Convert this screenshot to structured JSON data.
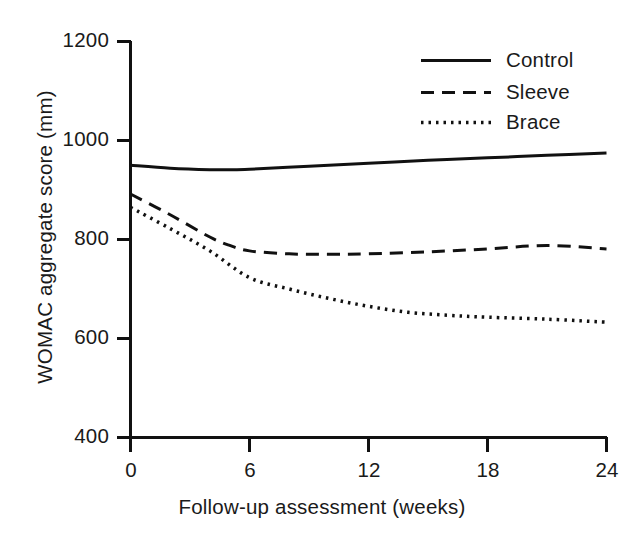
{
  "chart_data": {
    "type": "line",
    "title": "",
    "xlabel": "Follow-up assessment (weeks)",
    "ylabel": "WOMAC aggregate score (mm)",
    "xlim": [
      0,
      24
    ],
    "ylim": [
      400,
      1200
    ],
    "xticks": [
      "0",
      "6",
      "12",
      "18",
      "24"
    ],
    "yticks": [
      "400",
      "600",
      "800",
      "1000",
      "1200"
    ],
    "grid": false,
    "legend_position": "top-right",
    "series": [
      {
        "name": "Control",
        "style": "solid",
        "color": "#111111",
        "x": [
          0,
          2,
          4,
          5,
          6,
          9,
          12,
          15,
          18,
          21,
          24
        ],
        "values": [
          950,
          944,
          941,
          941,
          942,
          948,
          954,
          960,
          965,
          970,
          975
        ]
      },
      {
        "name": "Sleeve",
        "style": "dashed",
        "color": "#111111",
        "x": [
          0,
          2,
          4,
          5,
          6,
          8,
          10,
          12,
          15,
          18,
          21,
          24
        ],
        "values": [
          892,
          850,
          805,
          788,
          777,
          771,
          770,
          771,
          775,
          781,
          788,
          781
        ]
      },
      {
        "name": "Brace",
        "style": "dotted",
        "color": "#111111",
        "x": [
          0,
          2,
          4,
          6,
          8,
          10,
          12,
          14,
          16,
          18,
          21,
          24
        ],
        "values": [
          865,
          822,
          777,
          723,
          700,
          681,
          665,
          653,
          647,
          643,
          639,
          633
        ]
      }
    ]
  },
  "legend": {
    "items": [
      {
        "label": "Control",
        "style": "solid"
      },
      {
        "label": "Sleeve",
        "style": "dashed"
      },
      {
        "label": "Brace",
        "style": "dotted"
      }
    ]
  },
  "axes": {
    "x_title": "Follow-up assessment (weeks)",
    "y_title": "WOMAC aggregate score (mm)",
    "x_tick_labels": [
      "0",
      "6",
      "12",
      "18",
      "24"
    ],
    "y_tick_labels": [
      "400",
      "600",
      "800",
      "1000",
      "1200"
    ]
  }
}
